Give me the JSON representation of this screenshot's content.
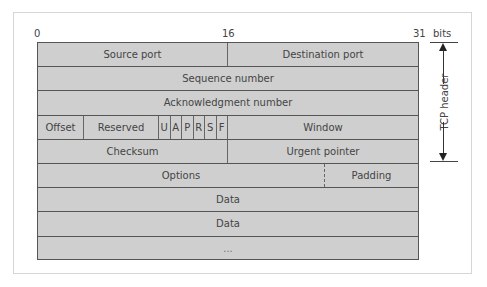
{
  "bit_labels": {
    "start": "0",
    "middle": "16",
    "end": "31",
    "unit": "bits"
  },
  "side_label": "TCP header",
  "rows": [
    {
      "cells": [
        "Source port",
        "Destination port"
      ]
    },
    {
      "cells": [
        "Sequence number"
      ]
    },
    {
      "cells": [
        "Acknowledgment number"
      ]
    },
    {
      "cells": [
        "Offset",
        "Reserved",
        "U",
        "A",
        "P",
        "R",
        "S",
        "F",
        "Window"
      ]
    },
    {
      "cells": [
        "Checksum",
        "Urgent pointer"
      ]
    },
    {
      "cells": [
        "Options",
        "Padding"
      ]
    },
    {
      "cells": [
        "Data"
      ]
    },
    {
      "cells": [
        "Data"
      ]
    },
    {
      "cells": [
        "..."
      ]
    }
  ],
  "colors": {
    "field_fill": "#cfcfcf",
    "border": "#555555",
    "background": "#ffffff"
  }
}
